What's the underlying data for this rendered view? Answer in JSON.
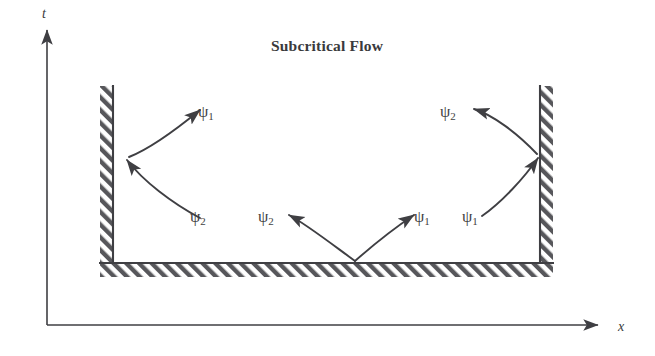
{
  "figure": {
    "title": "Subcritical Flow",
    "width": 655,
    "height": 356,
    "background_color": "#ffffff",
    "ink_color": "#3f3f43",
    "hatch_color": "#555559"
  },
  "axes": {
    "t_axis_label": "t",
    "x_axis_label": "x",
    "origin": {
      "x": 47,
      "y": 325
    },
    "t_axis_tip": {
      "x": 47,
      "y": 22
    },
    "x_axis_tip": {
      "x": 606,
      "y": 325
    }
  },
  "walls": {
    "left_wall": {
      "name": "left boundary wall",
      "x": 100,
      "y": 86,
      "width": 13,
      "height": 191,
      "face_side": "right",
      "hatch_direction": "forward-slash"
    },
    "right_wall": {
      "name": "right boundary wall",
      "x": 540,
      "y": 86,
      "width": 13,
      "height": 191,
      "face_side": "left",
      "hatch_direction": "forward-slash"
    },
    "bottom_wall": {
      "name": "bottom boundary wall",
      "x": 100,
      "y": 263,
      "width": 453,
      "height": 14,
      "face_side": "top",
      "hatch_direction": "forward-slash"
    }
  },
  "characteristics": [
    {
      "id": "left-outgoing",
      "label": "ψ",
      "subscript": "1",
      "label_x": 198,
      "label_y": 117,
      "direction": "away-from-left-wall",
      "path": "M 129 157 C 152 148 178 128 200 110",
      "arrow_at": "end"
    },
    {
      "id": "left-incoming",
      "label": "ψ",
      "subscript": "2",
      "label_x": 190,
      "label_y": 222,
      "direction": "toward-left-wall",
      "path": "M 200 218 C 172 203 143 181 127 160",
      "arrow_at": "end"
    },
    {
      "id": "floor-left-outgoing",
      "label": "ψ",
      "subscript": "2",
      "label_x": 258,
      "label_y": 222,
      "direction": "up-left-from-floor",
      "path": "M 355 261 C 333 245 306 224 289 215",
      "arrow_at": "end"
    },
    {
      "id": "floor-right-outgoing",
      "label": "ψ",
      "subscript": "1",
      "label_x": 414,
      "label_y": 222,
      "direction": "up-right-from-floor",
      "path": "M 355 261 C 372 246 396 227 414 215",
      "arrow_at": "end"
    },
    {
      "id": "right-outgoing",
      "label": "ψ",
      "subscript": "2",
      "label_x": 440,
      "label_y": 117,
      "direction": "away-from-right-wall",
      "path": "M 537 154 C 517 133 493 115 474 109",
      "arrow_at": "end"
    },
    {
      "id": "right-incoming",
      "label": "ψ",
      "subscript": "1",
      "label_x": 462,
      "label_y": 222,
      "direction": "toward-right-wall",
      "path": "M 482 216 C 502 202 524 178 538 158",
      "arrow_at": "end"
    }
  ]
}
